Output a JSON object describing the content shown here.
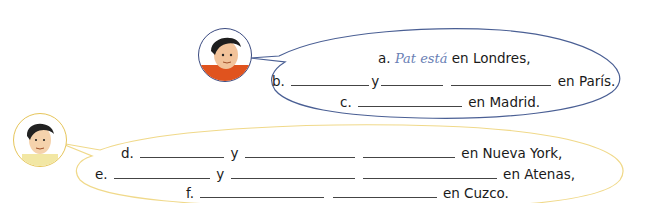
{
  "speakers": [
    {
      "id": "pat",
      "avatar": "boy-red-shirt-avatar",
      "bubble_color": "#4a5f94",
      "lines": [
        {
          "label": "a.",
          "answer": "Pat está",
          "suffix": "en Londres,"
        },
        {
          "label": "b.",
          "conj": "y",
          "suffix": "en París."
        },
        {
          "label": "c.",
          "suffix": "en Madrid."
        }
      ]
    },
    {
      "id": "second",
      "avatar": "boy-yellow-shirt-avatar",
      "bubble_color": "#f0d98a",
      "lines": [
        {
          "label": "d.",
          "conj": "y",
          "suffix": "en Nueva York,"
        },
        {
          "label": "e.",
          "conj": "y",
          "suffix": "en Atenas,"
        },
        {
          "label": "f.",
          "suffix": "en Cuzco."
        }
      ]
    }
  ]
}
